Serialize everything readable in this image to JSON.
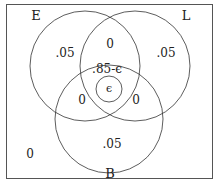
{
  "diagram": {
    "sets": [
      {
        "name": "E",
        "label": "E"
      },
      {
        "name": "L",
        "label": "L"
      },
      {
        "name": "B",
        "label": "B"
      }
    ],
    "regions": {
      "e_only": ".05",
      "l_only": ".05",
      "b_only": ".05",
      "e_and_l_only": "0",
      "e_and_b_only": "0",
      "l_and_b_only": "0",
      "all_three": ".85-ϵ",
      "inner_epsilon": "ϵ",
      "outside": "0"
    }
  }
}
